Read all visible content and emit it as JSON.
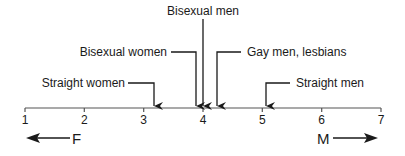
{
  "diagram": {
    "type": "number-line",
    "axis": {
      "min": 1,
      "max": 7,
      "ticks": [
        "1",
        "2",
        "3",
        "4",
        "5",
        "6",
        "7"
      ]
    },
    "directions": {
      "left": "F",
      "right": "M"
    },
    "markers": [
      {
        "label": "Straight women",
        "value": 3.18
      },
      {
        "label": "Bisexual women",
        "value": 3.88
      },
      {
        "label": "Bisexual men",
        "value": 4.0
      },
      {
        "label": "Gay men, lesbians",
        "value": 4.24
      },
      {
        "label": "Straight men",
        "value": 5.06
      }
    ]
  }
}
